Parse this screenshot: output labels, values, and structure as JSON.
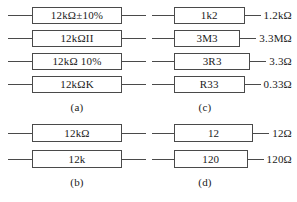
{
  "figure": {
    "groups": [
      {
        "id": "a",
        "caption": "(a)",
        "has_values": false,
        "rows": [
          {
            "marking": "12kΩ±10%",
            "value": ""
          },
          {
            "marking": "12kΩII",
            "value": ""
          },
          {
            "marking": "12kΩ 10%",
            "value": ""
          },
          {
            "marking": "12kΩK",
            "value": ""
          }
        ]
      },
      {
        "id": "b",
        "caption": "(b)",
        "has_values": false,
        "rows": [
          {
            "marking": "12kΩ",
            "value": ""
          },
          {
            "marking": "12k",
            "value": ""
          }
        ]
      },
      {
        "id": "c",
        "caption": "(c)",
        "has_values": true,
        "rows": [
          {
            "marking": "1k2",
            "value": "1.2kΩ"
          },
          {
            "marking": "3M3",
            "value": "3.3MΩ"
          },
          {
            "marking": "3R3",
            "value": "3.3Ω"
          },
          {
            "marking": "R33",
            "value": "0.33Ω"
          }
        ]
      },
      {
        "id": "d",
        "caption": "(d)",
        "has_values": true,
        "rows": [
          {
            "marking": "12",
            "value": "12Ω"
          },
          {
            "marking": "120",
            "value": "120Ω"
          }
        ]
      }
    ],
    "colors": {
      "stroke": "#4a4a4a",
      "text": "#1a1a1a",
      "background": "#ffffff"
    }
  }
}
